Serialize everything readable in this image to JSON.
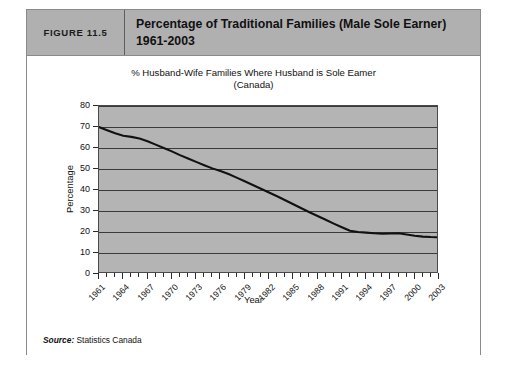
{
  "figure": {
    "number_label": "FIGURE 11.5",
    "title_line1": "Percentage of Traditional Families (Male Sole Earner)",
    "title_line2": "1961-2003",
    "source_prefix": "Source:",
    "source_text": " Statistics Canada"
  },
  "chart_data": {
    "type": "line",
    "title": "% Husband-Wife Families Where Husband is Sole Eamer",
    "subtitle": "(Canada)",
    "xlabel": "Year",
    "ylabel": "Percentage",
    "ylim": [
      0,
      80
    ],
    "xlim": [
      1961,
      2003
    ],
    "yticks": [
      0,
      10,
      20,
      30,
      40,
      50,
      60,
      70,
      80
    ],
    "xticks_labeled": [
      1961,
      1964,
      1967,
      1970,
      1973,
      1976,
      1979,
      1982,
      1985,
      1988,
      1991,
      1994,
      1997,
      2000,
      2003
    ],
    "grid": "horizontal",
    "legend": "none",
    "line_color": "#111111",
    "plot_background": "#b4b4b4",
    "x": [
      1961,
      1962,
      1963,
      1964,
      1965,
      1966,
      1967,
      1968,
      1969,
      1970,
      1971,
      1972,
      1973,
      1974,
      1975,
      1976,
      1977,
      1978,
      1979,
      1980,
      1981,
      1982,
      1983,
      1984,
      1985,
      1986,
      1987,
      1988,
      1989,
      1990,
      1991,
      1992,
      1993,
      1994,
      1995,
      1996,
      1997,
      1998,
      1999,
      2000,
      2001,
      2002,
      2003
    ],
    "values": [
      70.0,
      68.5,
      67.0,
      65.8,
      65.3,
      64.5,
      63.2,
      61.6,
      60.0,
      58.4,
      56.6,
      55.0,
      53.4,
      51.8,
      50.3,
      49.0,
      47.6,
      45.9,
      44.2,
      42.4,
      40.6,
      38.8,
      37.0,
      35.1,
      33.2,
      31.3,
      29.4,
      27.6,
      25.8,
      24.0,
      22.3,
      20.6,
      20.0,
      19.7,
      19.4,
      19.2,
      19.3,
      19.4,
      18.8,
      18.2,
      17.8,
      17.6,
      17.5
    ]
  }
}
